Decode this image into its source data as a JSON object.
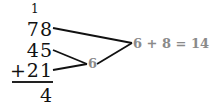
{
  "problem": {
    "carry": "1",
    "rows": [
      "78",
      "45",
      "+21"
    ],
    "result": "4"
  },
  "annotations": {
    "partial_sum": "6",
    "ones_sum": "6 + 8 = 14"
  },
  "colors": {
    "digits": "#111111",
    "annotation": "#8a8a8a",
    "lines": "#111111"
  }
}
